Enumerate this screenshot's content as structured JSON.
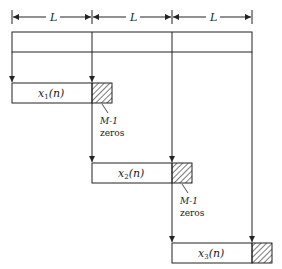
{
  "dimension_labels": [
    "L",
    "L",
    "L"
  ],
  "blocks": [
    {
      "label_main": "x",
      "label_sub": "1",
      "label_arg": "(n)",
      "zeros_label_line1": "M-1",
      "zeros_label_line2": "zeros"
    },
    {
      "label_main": "x",
      "label_sub": "2",
      "label_arg": "(n)",
      "zeros_label_line1": "M-1",
      "zeros_label_line2": "zeros"
    },
    {
      "label_main": "x",
      "label_sub": "3",
      "label_arg": "(n)"
    }
  ],
  "colors": {
    "line": "#222222",
    "background": "#ffffff"
  }
}
